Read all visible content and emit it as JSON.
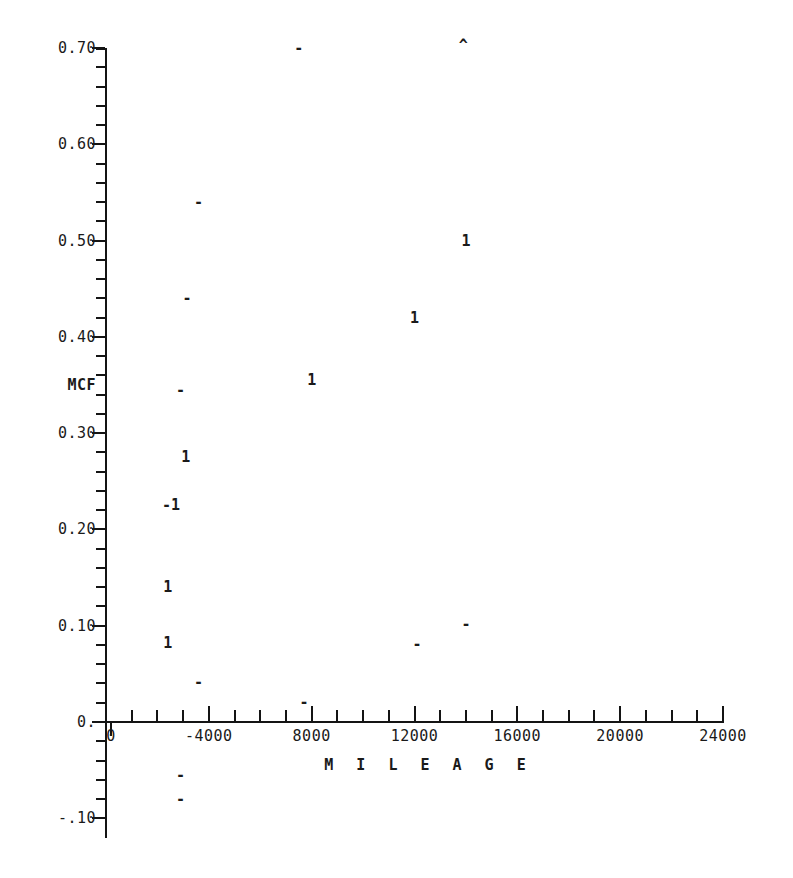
{
  "chart_data": {
    "type": "scatter",
    "title": "",
    "xlabel": "M I L E A G E",
    "ylabel": "MCF",
    "xlim": [
      0,
      24000
    ],
    "ylim": [
      -0.1,
      0.7
    ],
    "grid": false,
    "legend": "none",
    "x_tick_labels": [
      "0",
      "-4000",
      "8000",
      "12000",
      "16000",
      "20000",
      "24000"
    ],
    "x_tick_values": [
      0,
      4000,
      8000,
      12000,
      16000,
      20000,
      24000
    ],
    "x_minor_tick_step": 1000,
    "y_tick_labels": [
      "0.70",
      "0.60",
      "0.50",
      "0.40",
      "0.30",
      "0.20",
      "0.10",
      "0.",
      "-.10"
    ],
    "y_tick_values": [
      0.7,
      0.6,
      0.5,
      0.4,
      0.3,
      0.2,
      0.1,
      0.0,
      -0.1
    ],
    "y_minor_tick_step": 0.02,
    "marker_symbols": {
      "one": "1",
      "dash": "-",
      "caret": "^"
    },
    "series": [
      {
        "name": "1",
        "symbol": "1",
        "points": [
          {
            "x": 14000,
            "y": 0.5
          },
          {
            "x": 12000,
            "y": 0.42
          },
          {
            "x": 8000,
            "y": 0.355
          },
          {
            "x": 3100,
            "y": 0.275
          },
          {
            "x": 2700,
            "y": 0.225
          },
          {
            "x": 2400,
            "y": 0.14
          },
          {
            "x": 2400,
            "y": 0.082
          }
        ]
      },
      {
        "name": "-",
        "symbol": "-",
        "points": [
          {
            "x": 7500,
            "y": 0.7
          },
          {
            "x": 3600,
            "y": 0.54
          },
          {
            "x": 3150,
            "y": 0.44
          },
          {
            "x": 2900,
            "y": 0.345
          },
          {
            "x": 2350,
            "y": 0.225
          },
          {
            "x": 14000,
            "y": 0.102
          },
          {
            "x": 12100,
            "y": 0.081
          },
          {
            "x": 3600,
            "y": 0.042
          },
          {
            "x": 7700,
            "y": 0.021
          },
          {
            "x": 2900,
            "y": -0.055
          },
          {
            "x": 2900,
            "y": -0.08
          }
        ]
      },
      {
        "name": "^",
        "symbol": "^",
        "points": [
          {
            "x": 13900,
            "y": 0.703
          }
        ]
      }
    ]
  },
  "axes": {
    "y_title": "MCF",
    "y_title_value": 0.35,
    "x_title": "M I L E A G E"
  },
  "colors": {
    "ink": "#1a1a1a",
    "axis": "#141414",
    "background": "#ffffff"
  }
}
